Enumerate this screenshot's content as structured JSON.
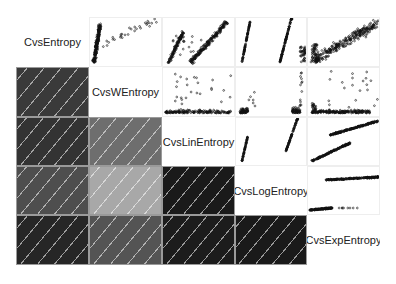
{
  "chart_data": {
    "type": "heatmap",
    "title": "",
    "subtitle": "Correlogram (lower panel: shaded correlation, upper panel: scatter plots)",
    "variables": [
      "CvsEntropy",
      "CvsWEntropy",
      "CvsLinEntropy",
      "CvsLogEntropy",
      "CvsExpEntropy"
    ],
    "lower_panel": "shade",
    "upper_panel": "points",
    "diagonal_panel": "text labels",
    "correlation_shades": [
      {
        "row": "CvsWEntropy",
        "col": "CvsEntropy",
        "shade": "#3a3a3a",
        "approx_r": 0.78
      },
      {
        "row": "CvsLinEntropy",
        "col": "CvsEntropy",
        "shade": "#333333",
        "approx_r": 0.82
      },
      {
        "row": "CvsLinEntropy",
        "col": "CvsWEntropy",
        "shade": "#6e6e6e",
        "approx_r": 0.55
      },
      {
        "row": "CvsLogEntropy",
        "col": "CvsEntropy",
        "shade": "#4e4e4e",
        "approx_r": 0.68
      },
      {
        "row": "CvsLogEntropy",
        "col": "CvsWEntropy",
        "shade": "#a8a8a8",
        "approx_r": 0.3
      },
      {
        "row": "CvsLogEntropy",
        "col": "CvsLinEntropy",
        "shade": "#1a1a1a",
        "approx_r": 0.93
      },
      {
        "row": "CvsExpEntropy",
        "col": "CvsEntropy",
        "shade": "#262626",
        "approx_r": 0.88
      },
      {
        "row": "CvsExpEntropy",
        "col": "CvsWEntropy",
        "shade": "#545454",
        "approx_r": 0.65
      },
      {
        "row": "CvsExpEntropy",
        "col": "CvsLinEntropy",
        "shade": "#1c1c1c",
        "approx_r": 0.92
      },
      {
        "row": "CvsExpEntropy",
        "col": "CvsLogEntropy",
        "shade": "#1a1a1a",
        "approx_r": 0.93
      }
    ],
    "hatch": "diagonal white lines (positive correlation)",
    "grid": false,
    "legend": "none"
  },
  "labels": {
    "v0": "CvsEntropy",
    "v1": "CvsWEntropy",
    "v2": "CvsLinEntropy",
    "v3": "CvsLogEntropy",
    "v4": "CvsExpEntropy"
  },
  "colors": {
    "s10": "#3a3a3a",
    "s20": "#333333",
    "s21": "#6e6e6e",
    "s30": "#4e4e4e",
    "s31": "#a8a8a8",
    "s32": "#1a1a1a",
    "s40": "#262626",
    "s41": "#545454",
    "s42": "#1c1c1c",
    "s43": "#1a1a1a",
    "point": "#111111"
  }
}
